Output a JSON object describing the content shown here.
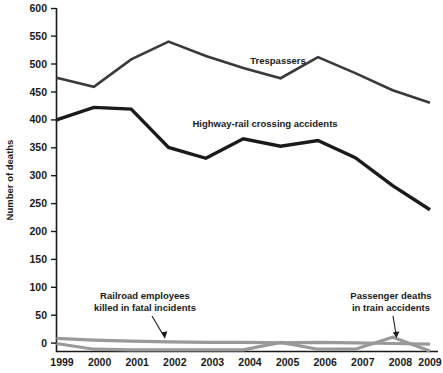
{
  "chart_data": {
    "type": "line",
    "title": "",
    "xlabel": "",
    "ylabel": "Number of deaths",
    "categories": [
      "1999",
      "2000",
      "2001",
      "2002",
      "2003",
      "2004",
      "2005",
      "2006",
      "2007",
      "2008",
      "2009"
    ],
    "x": [
      1999,
      2000,
      2001,
      2002,
      2003,
      2004,
      2005,
      2006,
      2007,
      2008,
      2009
    ],
    "ylim": [
      0,
      600
    ],
    "xlim": [
      1999,
      2009
    ],
    "yticks": [
      0,
      50,
      100,
      150,
      200,
      250,
      300,
      350,
      400,
      450,
      500,
      550,
      600
    ],
    "grid": false,
    "legend": "none (inline annotations)",
    "series": [
      {
        "name": "Trespassers",
        "color": "#3a3a3a",
        "values": [
          479,
          463,
          511,
          542,
          517,
          496,
          478,
          515,
          487,
          457,
          435
        ]
      },
      {
        "name": "Highway-rail crossing accidents",
        "color": "#1a1a1a",
        "values": [
          405,
          427,
          424,
          357,
          338,
          372,
          359,
          369,
          339,
          290,
          248
        ]
      },
      {
        "name": "Railroad employees killed in fatal incidents",
        "color": "#999999",
        "values": [
          23,
          20,
          18,
          17,
          16,
          16,
          15,
          16,
          15,
          14,
          13
        ]
      },
      {
        "name": "Passenger deaths in train accidents",
        "color": "#999999",
        "values": [
          14,
          4,
          3,
          3,
          3,
          3,
          16,
          4,
          4,
          25,
          1
        ]
      }
    ],
    "annotations": [
      {
        "text": "Trespassers",
        "series": "Trespassers"
      },
      {
        "text": "Highway-rail crossing accidents",
        "series": "Highway-rail crossing accidents"
      },
      {
        "text_line1": "Railroad employees",
        "text_line2": "killed in fatal incidents",
        "series": "Railroad employees killed in fatal incidents"
      },
      {
        "text_line1": "Passenger deaths",
        "text_line2": "in train accidents",
        "series": "Passenger deaths in train accidents"
      }
    ]
  },
  "axis": {
    "y_title": "Number of deaths",
    "y_ticks": [
      "600",
      "550",
      "500",
      "450",
      "400",
      "350",
      "300",
      "250",
      "200",
      "150",
      "100",
      "50",
      "0"
    ],
    "x_ticks": [
      "1999",
      "2000",
      "2001",
      "2002",
      "2003",
      "2004",
      "2005",
      "2006",
      "2007",
      "2008",
      "2009"
    ]
  },
  "labels": {
    "trespassers": "Trespassers",
    "highway_rail": "Highway-rail crossing accidents",
    "employees_line1": "Railroad employees",
    "employees_line2": "killed in fatal incidents",
    "passengers_line1": "Passenger deaths",
    "passengers_line2": "in train accidents"
  },
  "colors": {
    "dark_line": "#1a1a1a",
    "trespassers_line": "#3a3a3a",
    "gray_line": "#999999",
    "background": "#ffffff"
  }
}
